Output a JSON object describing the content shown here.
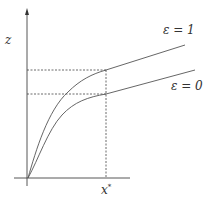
{
  "diagram": {
    "y_axis_label": "z",
    "x_marker_label": "x",
    "x_marker_superscript": "*",
    "curves": [
      {
        "name": "epsilon-1",
        "label": "ε = 1"
      },
      {
        "name": "epsilon-0",
        "label": "ε = 0"
      }
    ],
    "colors": {
      "line": "#555555",
      "axis": "#444444"
    }
  }
}
